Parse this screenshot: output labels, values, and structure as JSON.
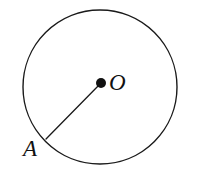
{
  "figure": {
    "type": "geometry-diagram",
    "background_color": "#ffffff",
    "stroke_color": "#1a1a1a",
    "canvas": {
      "width": 199,
      "height": 178
    },
    "circle": {
      "name": "main-circle",
      "center_x": 100,
      "center_y": 87,
      "radius": 77,
      "stroke_width": 1.4,
      "fill": "none"
    },
    "center_point": {
      "name": "center-dot",
      "x": 101,
      "y": 83,
      "radius": 5,
      "fill": "#111111"
    },
    "radius_segment": {
      "name": "radius-OA",
      "x1": 101,
      "y1": 83,
      "x2": 46,
      "y2": 139,
      "stroke_width": 1.3
    },
    "labels": [
      {
        "id": "O",
        "text": "O",
        "x": 109,
        "y": 71,
        "font_size": 23,
        "style": "italic-serif"
      },
      {
        "id": "A",
        "text": "A",
        "x": 23,
        "y": 137,
        "font_size": 23,
        "style": "italic-serif"
      }
    ]
  }
}
